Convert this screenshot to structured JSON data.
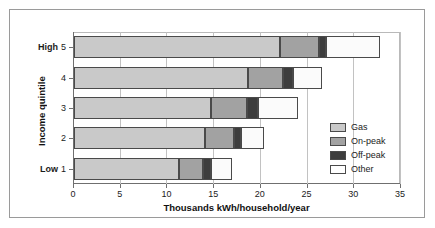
{
  "chart_data": {
    "type": "bar",
    "orientation": "horizontal",
    "stacked": true,
    "title": "",
    "xlabel": "Thousands kWh/household/year",
    "ylabel": "Income quintile",
    "xlim": [
      0,
      35
    ],
    "xticks": [
      0,
      5,
      10,
      15,
      20,
      25,
      30,
      35
    ],
    "xticklabels": [
      "0",
      "5",
      "10",
      "15",
      "20",
      "25",
      "30",
      "35"
    ],
    "grid": true,
    "grid_axis": "x",
    "legend_position": "right-inside",
    "categories": [
      "1",
      "2",
      "3",
      "4",
      "5"
    ],
    "category_edge_labels": {
      "low": "Low",
      "high": "High"
    },
    "yticklabels": [
      {
        "edge": "High",
        "num": "5"
      },
      {
        "edge": "",
        "num": "4"
      },
      {
        "edge": "",
        "num": "3"
      },
      {
        "edge": "",
        "num": "2"
      },
      {
        "edge": "Low",
        "num": "1"
      }
    ],
    "series": [
      {
        "name": "Gas",
        "color": "#c9c9c9",
        "values": [
          11.2,
          14.0,
          14.7,
          18.6,
          22.0
        ]
      },
      {
        "name": "On-peak",
        "color": "#a2a2a2",
        "values": [
          2.6,
          3.1,
          3.8,
          3.8,
          4.2
        ]
      },
      {
        "name": "Off-peak",
        "color": "#3d3d3d",
        "values": [
          0.9,
          0.8,
          1.2,
          1.0,
          0.8
        ]
      },
      {
        "name": "Other",
        "color": "#ffffff",
        "values": [
          2.2,
          2.4,
          4.3,
          3.1,
          5.7
        ]
      }
    ],
    "totals": [
      16.9,
      20.3,
      24.0,
      26.5,
      32.7
    ],
    "legend": [
      {
        "label": "Gas",
        "color": "#c9c9c9"
      },
      {
        "label": "On-peak",
        "color": "#a2a2a2"
      },
      {
        "label": "Off-peak",
        "color": "#3d3d3d"
      },
      {
        "label": "Other",
        "color": "#ffffff"
      }
    ]
  }
}
